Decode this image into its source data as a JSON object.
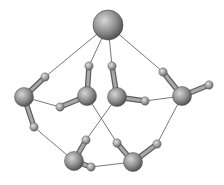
{
  "diagram": {
    "type": "ball-and-stick molecular cluster",
    "colors": {
      "atom_light": "#c8c8c8",
      "atom_mid": "#8c8c8c",
      "atom_dark": "#4a4a4a",
      "bond": "#8a8a8a",
      "hbond_line": "#555555",
      "background": "#ffffff"
    },
    "ion": {
      "x": 108,
      "y": 25,
      "r": 15
    },
    "waters": [
      {
        "name": "water-1",
        "O": [
          24,
          97
        ],
        "H": [
          [
            45,
            77
          ],
          [
            34,
            127
          ]
        ]
      },
      {
        "name": "water-2",
        "O": [
          87,
          96
        ],
        "H": [
          [
            89,
            66
          ],
          [
            60,
            107
          ]
        ]
      },
      {
        "name": "water-3",
        "O": [
          117,
          97
        ],
        "H": [
          [
            112,
            66
          ],
          [
            145,
            101
          ]
        ]
      },
      {
        "name": "water-4",
        "O": [
          182,
          96
        ],
        "H": [
          [
            163,
            72
          ],
          [
            209,
            85
          ]
        ]
      },
      {
        "name": "water-5",
        "O": [
          74,
          161
        ],
        "H": [
          [
            86,
            140
          ],
          [
            91,
            167
          ]
        ]
      },
      {
        "name": "water-6",
        "O": [
          133,
          162
        ],
        "H": [
          [
            117,
            143
          ],
          [
            157,
            144
          ]
        ]
      }
    ],
    "hbonds": [
      [
        108,
        25,
        45,
        77
      ],
      [
        108,
        25,
        89,
        66
      ],
      [
        108,
        25,
        112,
        66
      ],
      [
        108,
        25,
        163,
        72
      ],
      [
        24,
        97,
        60,
        107
      ],
      [
        145,
        101,
        182,
        96
      ],
      [
        34,
        127,
        74,
        161
      ],
      [
        117,
        97,
        86,
        140
      ],
      [
        87,
        96,
        117,
        143
      ],
      [
        182,
        96,
        157,
        144
      ],
      [
        91,
        167,
        133,
        162
      ]
    ]
  }
}
